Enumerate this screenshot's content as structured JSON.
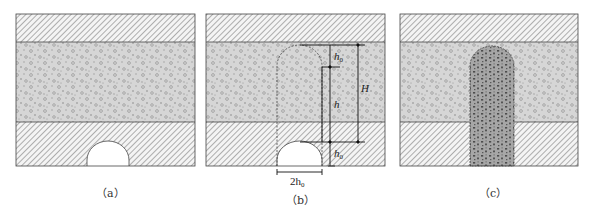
{
  "figure": {
    "panels": [
      {
        "id": "a",
        "caption": "（a）",
        "description": "Rock strata with arch-shaped tunnel cavity at bottom"
      },
      {
        "id": "b",
        "caption": "（b）",
        "description": "Caving zone geometry with dimension annotations"
      },
      {
        "id": "c",
        "caption": "（c）",
        "description": "Caved column filled with broken rock"
      }
    ],
    "labels": {
      "h0_top": "h",
      "h0_top_sub": "0",
      "h": "h",
      "H": "H",
      "h0_bottom": "h",
      "h0_bottom_sub": "0",
      "width_label": "2h",
      "width_label_sub": "0"
    },
    "colors": {
      "hatch_line": "#555555",
      "hatch_bg": "#f4f4f4",
      "conglomerate_bg": "#d4d4d4",
      "conglomerate_dots": "#8a8a8a",
      "caved_bg": "#a8a8a8",
      "caved_dots": "#4a4a4a",
      "border": "#444444"
    }
  }
}
